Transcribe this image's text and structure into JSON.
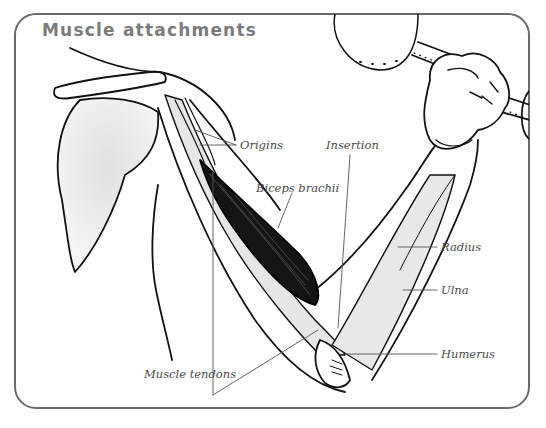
{
  "diagram": {
    "title": "Muscle attachments",
    "labels": {
      "origins": "Origins",
      "insertion": "Insertion",
      "biceps": "Biceps brachii",
      "radius": "Radius",
      "ulna": "Ulna",
      "humerus": "Humerus",
      "tendons": "Muscle tendons"
    },
    "colors": {
      "frame": "#6a6a6a",
      "title": "#7b7b7b",
      "label": "#4a4a4a",
      "bone_shade": "#e4e4e4",
      "muscle": "#111111"
    }
  }
}
